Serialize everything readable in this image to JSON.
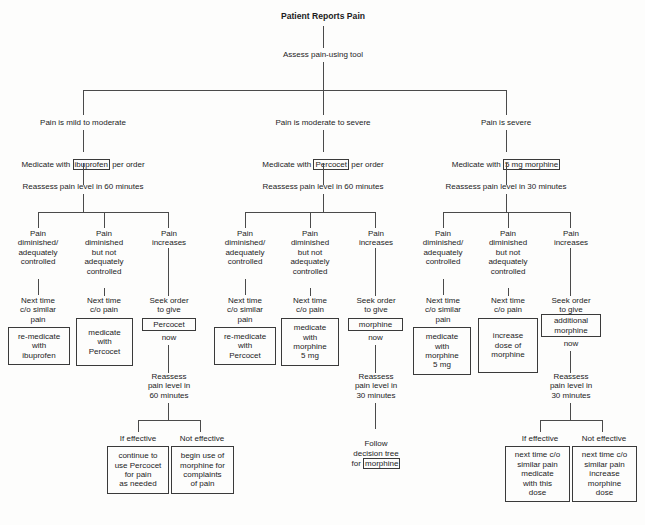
{
  "diagram": {
    "title": "Patient Reports Pain",
    "assess": "Assess pain-using tool",
    "branches": [
      {
        "id": "mild-moderate",
        "severity": "Pain is mild to moderate",
        "medicate_pre": "Medicate with ",
        "medicate_drug": "ibuprofen",
        "medicate_post": " per order",
        "reassess": "Reassess pain level in 60 minutes",
        "outcomes": [
          {
            "label": "Pain\ndiminished/\nadequately\ncontrolled",
            "action": "Next time\nc/o similar\npain",
            "box": "re-medicate\nwith\nibuprofen"
          },
          {
            "label": "Pain\ndiminished\nbut not\nadequately\ncontrolled",
            "action": "Next time\nc/o pain",
            "box": "medicate\nwith\nPercocet"
          },
          {
            "label": "Pain\nincreases",
            "action": "Seek order\nto give",
            "box_drug": "Percocet",
            "box_after": "now",
            "reassess2": "Reassess\npain level in\n60 minutes",
            "effective_label": "If effective",
            "effective_box": "continue to\nuse Percocet\nfor pain\nas needed",
            "not_effective_label": "Not effective",
            "not_effective_box": "begin use of\nmorphine for\ncomplaints\nof pain"
          }
        ]
      },
      {
        "id": "moderate-severe",
        "severity": "Pain is moderate to severe",
        "medicate_pre": "Medicate with ",
        "medicate_drug": "Percocet",
        "medicate_post": " per order",
        "reassess": "Reassess pain level in 60 minutes",
        "outcomes": [
          {
            "label": "Pain\ndiminished/\nadequately\ncontrolled",
            "action": "Next time\nc/o similar\npain",
            "box": "re-medicate\nwith\nPercocet"
          },
          {
            "label": "Pain\ndiminished\nbut not\nadequately\ncontrolled",
            "action": "Next time\nc/o pain",
            "box": "medicate\nwith\nmorphine\n5 mg"
          },
          {
            "label": "Pain\nincreases",
            "action": "Seek order\nto give",
            "box_drug": "morphine",
            "box_after": "now",
            "reassess2": "Reassess\npain level in\n30 minutes",
            "follow_pre": "Follow\ndecision tree\nfor ",
            "follow_drug": "morphine"
          }
        ]
      },
      {
        "id": "severe",
        "severity": "Pain is severe",
        "medicate_pre": "Medicate with ",
        "medicate_drug": "5 mg morphine",
        "medicate_post": "",
        "reassess": "Reassess pain level in 30 minutes",
        "outcomes": [
          {
            "label": "Pain\ndiminished/\nadequately\ncontrolled",
            "action": "Next time\nc/o similar\npain",
            "box": "medicate\nwith\nmorphine\n5 mg"
          },
          {
            "label": "Pain\ndiminished\nbut not\nadequately\ncontrolled",
            "action": "Next time\nc/o pain",
            "box": "increase\ndose of\nmorphine"
          },
          {
            "label": "Pain\nincreases",
            "action": "Seek order\nto give",
            "box_drug": "additional\nmorphine",
            "box_after": "now",
            "reassess2": "Reassess\npain level in\n30 minutes",
            "effective_label": "If effective",
            "effective_box": "next time c/o\nsimilar pain\nmedicate\nwith this\ndose",
            "not_effective_label": "Not effective",
            "not_effective_box": "next time c/o\nsimilar pain\nincrease\nmorphine\ndose"
          }
        ]
      }
    ]
  }
}
